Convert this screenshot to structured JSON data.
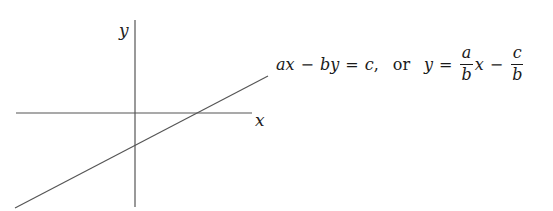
{
  "diagram": {
    "type": "cartesian-line-plot",
    "stroke_color": "#555555",
    "y_axis": {
      "label": "y",
      "x": 135,
      "y1": 20,
      "y2": 207
    },
    "x_axis": {
      "label": "x",
      "y": 113,
      "x1": 16,
      "x2": 252
    },
    "line": {
      "x1": 15,
      "y1": 208,
      "x2": 268,
      "y2": 76
    }
  },
  "equation": {
    "standard_form": {
      "a": "a",
      "x1": "x",
      "minus1": "−",
      "b": "b",
      "y1": "y",
      "equals1": "=",
      "c": "c",
      "comma": ","
    },
    "connector": "or",
    "slope_form": {
      "y": "y",
      "equals": "=",
      "frac1": {
        "num": "a",
        "den": "b"
      },
      "x": "x",
      "minus": "−",
      "frac2": {
        "num": "c",
        "den": "b"
      }
    }
  }
}
